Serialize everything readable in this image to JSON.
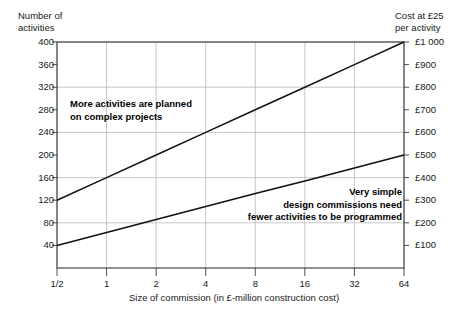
{
  "chart_data": {
    "type": "line",
    "title": "",
    "xlabel": "Size of commission (in £-million construction cost)",
    "ylabel": "Number of\nactivities",
    "ylabel_right": "Cost at £25\nper activity",
    "grid": true,
    "legend": "none",
    "x_scale": "log2",
    "x_tick_labels": [
      "1/2",
      "1",
      "2",
      "4",
      "8",
      "16",
      "32",
      "64"
    ],
    "x_tick_values": [
      0.5,
      1,
      2,
      4,
      8,
      16,
      32,
      64
    ],
    "y_tick_labels": [
      "400",
      "360",
      "320",
      "280",
      "240",
      "200",
      "160",
      "120",
      "80",
      "40"
    ],
    "y_tick_values": [
      400,
      360,
      320,
      280,
      240,
      200,
      160,
      120,
      80,
      40
    ],
    "ylim": [
      0,
      400
    ],
    "y_right_tick_labels": [
      "£1 000",
      "£900",
      "£800",
      "£700",
      "£600",
      "£500",
      "£400",
      "£300",
      "£200",
      "£100"
    ],
    "y_right_tick_values": [
      1000,
      900,
      800,
      700,
      600,
      500,
      400,
      300,
      200,
      100
    ],
    "y_gridline_values": [
      400,
      320,
      240,
      160,
      80
    ],
    "series": [
      {
        "name": "complex projects",
        "x": [
          0.5,
          1,
          2,
          4,
          8,
          16,
          32,
          64
        ],
        "values": [
          120,
          160,
          200,
          240,
          280,
          320,
          360,
          400
        ]
      },
      {
        "name": "simple design commissions",
        "x": [
          0.5,
          1,
          2,
          4,
          8,
          16,
          32,
          64
        ],
        "values": [
          40,
          63,
          86,
          109,
          132,
          154,
          177,
          200
        ]
      }
    ],
    "annotations": [
      {
        "id": "upper",
        "text": "More activities are planned\non complex projects",
        "align": "left"
      },
      {
        "id": "lower",
        "text": "Very simple\ndesign commissions need\nfewer activities to be programmed",
        "align": "right"
      }
    ],
    "colors": {
      "line": "#111111",
      "grid": "#b9b9b9",
      "frame": "#3a3a3a",
      "text": "#1a1a1a"
    }
  }
}
